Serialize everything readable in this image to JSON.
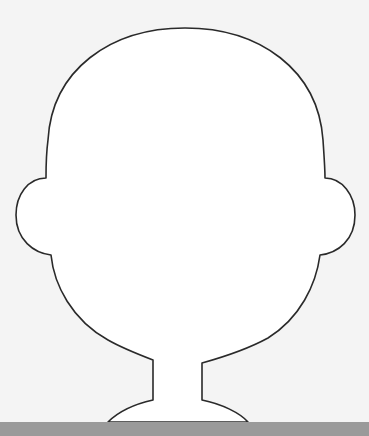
{
  "page": {
    "background_color": "#f4f4f4"
  },
  "figure": {
    "fill_color": "#ffffff",
    "stroke_color": "#2a2a2a",
    "stroke_width": 1.6
  },
  "bottom_bar": {
    "color": "#9a9a9a"
  }
}
